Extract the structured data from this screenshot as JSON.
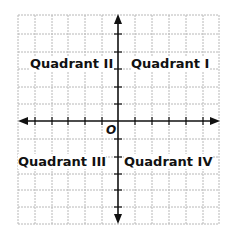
{
  "diagram": {
    "origin_label": "O",
    "quadrants": [
      {
        "id": "q2",
        "label": "Quadrant II"
      },
      {
        "id": "q1",
        "label": "Quadrant I"
      },
      {
        "id": "q3",
        "label": "Quadrant III"
      },
      {
        "id": "q4",
        "label": "Quadrant IV"
      }
    ],
    "grid": {
      "columns": 12,
      "rows": 12,
      "line_color": "#b5b5b5",
      "axis_color": "#111111"
    }
  }
}
